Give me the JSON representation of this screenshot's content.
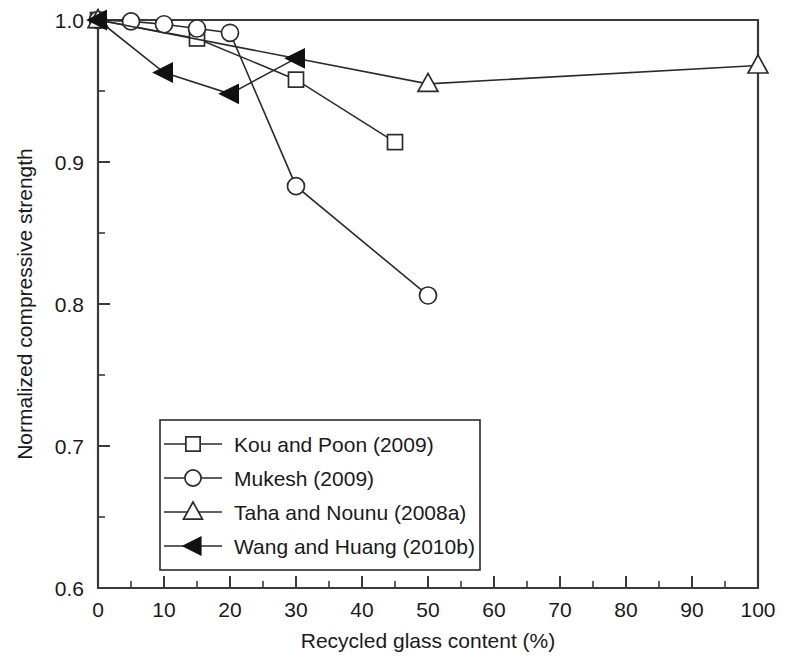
{
  "chart_data": {
    "type": "line",
    "title": "",
    "xlabel": "Recycled glass content (%)",
    "ylabel": "Normalized compressive strength",
    "xlim": [
      0,
      100
    ],
    "ylim": [
      0.6,
      1.0
    ],
    "xticks": [
      0,
      10,
      20,
      30,
      40,
      50,
      60,
      70,
      80,
      90,
      100
    ],
    "xtick_labels": [
      "0",
      "10",
      "20",
      "30",
      "40",
      "50",
      "60",
      "70",
      "80",
      "90",
      "100"
    ],
    "xminor_ticks": [
      5,
      15,
      25,
      35,
      45,
      55,
      65,
      75,
      85,
      95
    ],
    "yticks": [
      0.6,
      0.7,
      0.8,
      0.9,
      1.0
    ],
    "ytick_labels": [
      "0.6",
      "0.7",
      "0.8",
      "0.9",
      "1.0"
    ],
    "yminor_ticks": [
      0.65,
      0.75,
      0.85,
      0.95
    ],
    "grid": false,
    "legend_position": "lower-left-inside",
    "series": [
      {
        "name": "Kou and Poon (2009)",
        "marker": "square-open",
        "x": [
          0,
          15,
          30,
          45
        ],
        "y": [
          1.0,
          0.987,
          0.958,
          0.914
        ]
      },
      {
        "name": "Mukesh (2009)",
        "marker": "circle-open",
        "x": [
          0,
          5,
          10,
          15,
          20,
          30,
          50
        ],
        "y": [
          1.0,
          0.999,
          0.997,
          0.994,
          0.991,
          0.883,
          0.806
        ]
      },
      {
        "name": "Taha and Nounu (2008a)",
        "marker": "triangle-up-open",
        "x": [
          0,
          50,
          100
        ],
        "y": [
          1.0,
          0.955,
          0.968
        ]
      },
      {
        "name": "Wang and Huang (2010b)",
        "marker": "triangle-left-filled",
        "x": [
          0,
          10,
          20,
          30
        ],
        "y": [
          1.0,
          0.963,
          0.948,
          0.973
        ]
      }
    ]
  },
  "legend": {
    "entries": [
      {
        "label": "Kou and Poon (2009)",
        "marker": "square-open"
      },
      {
        "label": "Mukesh (2009)",
        "marker": "circle-open"
      },
      {
        "label": "Taha and Nounu (2008a)",
        "marker": "triangle-up-open"
      },
      {
        "label": "Wang and Huang (2010b)",
        "marker": "triangle-left-filled"
      }
    ]
  },
  "colors": {
    "background": "#ffffff",
    "axis": "#3a3a3a",
    "line": "#2b2b2b",
    "marker_fill_open": "#ffffff",
    "marker_fill_solid": "#111111",
    "text": "#1a1a1a"
  }
}
